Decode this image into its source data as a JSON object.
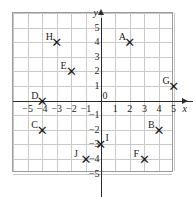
{
  "figure": {
    "kind": "cartesian-coordinate-plane",
    "marker_glyph": "✕",
    "axis_labels": {
      "x": "x",
      "y": "y"
    },
    "origin_label": "0",
    "grid": {
      "x_min": -6,
      "x_max": 5,
      "y_min": -5,
      "y_max": 6,
      "cell_px": 14.6,
      "line_color": "#c9c9c9",
      "border_color": "#9a9a9a",
      "axis_color": "#2b2b2b"
    },
    "x_ticks": [
      {
        "label": "−5",
        "value": -5
      },
      {
        "label": "−4",
        "value": -4
      },
      {
        "label": "−3",
        "value": -3
      },
      {
        "label": "−2",
        "value": -2
      },
      {
        "label": "−1",
        "value": -1
      },
      {
        "label": "1",
        "value": 1
      },
      {
        "label": "2",
        "value": 2
      },
      {
        "label": "3",
        "value": 3
      },
      {
        "label": "4",
        "value": 4
      },
      {
        "label": "5",
        "value": 5
      }
    ],
    "y_ticks": [
      {
        "label": "5",
        "value": 5
      },
      {
        "label": "4",
        "value": 4
      },
      {
        "label": "3",
        "value": 3
      },
      {
        "label": "2",
        "value": 2
      },
      {
        "label": "1",
        "value": 1
      },
      {
        "label": "−1",
        "value": -1
      },
      {
        "label": "−2",
        "value": -2
      },
      {
        "label": "−3",
        "value": -3
      },
      {
        "label": "−4",
        "value": -4
      },
      {
        "label": "−5",
        "value": -5
      }
    ],
    "points": [
      {
        "label": "A",
        "x": 2,
        "y": 4,
        "lx": -11,
        "ly": -10
      },
      {
        "label": "B",
        "x": 4,
        "y": -2,
        "lx": -11,
        "ly": -10
      },
      {
        "label": "C",
        "x": -4,
        "y": -2,
        "lx": -11,
        "ly": -10
      },
      {
        "label": "D",
        "x": -4,
        "y": 0,
        "lx": -11,
        "ly": -10
      },
      {
        "label": "E",
        "x": -2,
        "y": 2,
        "lx": -11,
        "ly": -10
      },
      {
        "label": "F",
        "x": 3,
        "y": -4,
        "lx": -11,
        "ly": -10
      },
      {
        "label": "G",
        "x": 5,
        "y": 1,
        "lx": -11,
        "ly": -10
      },
      {
        "label": "H",
        "x": -3,
        "y": 4,
        "lx": -11,
        "ly": -10
      },
      {
        "label": "I",
        "x": 0,
        "y": -3,
        "lx": 5,
        "ly": -11
      },
      {
        "label": "J",
        "x": -1,
        "y": -4,
        "lx": -12,
        "ly": -10
      }
    ]
  }
}
